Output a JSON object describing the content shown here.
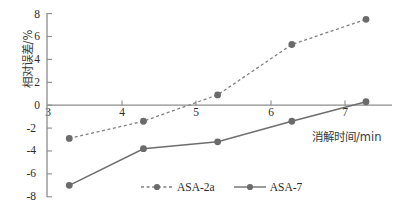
{
  "chart_data": {
    "type": "line",
    "title": "",
    "xlabel": "消解时间/min",
    "ylabel": "相对误差/%",
    "x": [
      3,
      4,
      5,
      6,
      7
    ],
    "xtick_labels": [
      "3",
      "4",
      "5",
      "6",
      "7"
    ],
    "ytick_labels": [
      "8",
      "6",
      "4",
      "2",
      "0",
      "-2",
      "-4",
      "-6",
      "-8"
    ],
    "ytick_values": [
      8,
      6,
      4,
      2,
      0,
      -2,
      -4,
      -6,
      -8
    ],
    "xlim": [
      2.7,
      7.35
    ],
    "ylim": [
      -8,
      8
    ],
    "grid": false,
    "legend_position": "bottom-center",
    "series": [
      {
        "name": "ASA-2a",
        "style": "dashed",
        "color": "#808080",
        "marker": "circle",
        "values": [
          -2.9,
          -1.4,
          0.9,
          5.3,
          7.5
        ]
      },
      {
        "name": "ASA-7",
        "style": "solid",
        "color": "#6e6e6e",
        "marker": "circle",
        "values": [
          -7.0,
          -3.8,
          -3.2,
          -1.4,
          0.3
        ]
      }
    ]
  },
  "colors": {
    "axis": "#8c8c8c",
    "series_dashed": "#808080",
    "series_solid": "#6e6e6e",
    "marker": "#6b6b6b",
    "tick_text": "#2b2b2b",
    "label_text": "#3a3a3a",
    "background": "#ffffff"
  }
}
